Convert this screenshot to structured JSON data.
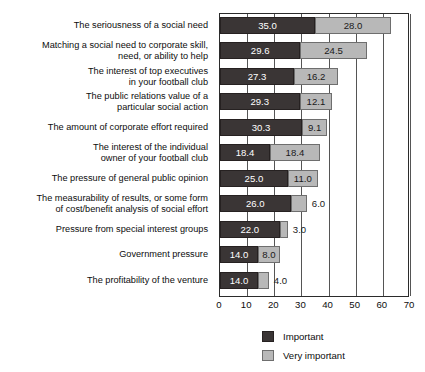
{
  "chart_data": {
    "type": "bar",
    "orientation": "horizontal",
    "stacked": true,
    "title": "",
    "subtitle": "",
    "xlabel": "",
    "ylabel": "",
    "xlim": [
      0,
      70
    ],
    "xticks": [
      0,
      10,
      20,
      30,
      40,
      50,
      60,
      70
    ],
    "xtick_labels": [
      "0",
      "10",
      "20",
      "30",
      "40",
      "50",
      "60",
      "70"
    ],
    "grid": true,
    "grid_axis": "x",
    "legend_position": "bottom",
    "categories": [
      "The seriousness of a social need",
      "Matching a social need to corporate skill,\nneed, or ability to help",
      "The interest of top executives\nin your football club",
      "The public relations value of a\nparticular social action",
      "The amount of corporate effort required",
      "The interest of the individual\nowner of your football club",
      "The pressure of general public opinion",
      "The measurability of results, or some form\nof cost/benefit analysis of social effort",
      "Pressure from special interest groups",
      "Government pressure",
      "The profitability of the venture"
    ],
    "series": [
      {
        "name": "Important",
        "color": "#3a3535",
        "values": [
          35.0,
          29.6,
          27.3,
          29.3,
          30.3,
          18.4,
          25.0,
          26.0,
          22.0,
          14.0,
          14.0
        ],
        "labels": [
          "35.0",
          "29.6",
          "27.3",
          "29.3",
          "30.3",
          "18.4",
          "25.0",
          "26.0",
          "22.0",
          "14.0",
          "14.0"
        ]
      },
      {
        "name": "Very important",
        "color": "#b8b8b8",
        "values": [
          28.0,
          24.5,
          16.2,
          12.1,
          9.1,
          18.4,
          11.0,
          6.0,
          3.0,
          8.0,
          4.0
        ],
        "labels": [
          "28.0",
          "24.5",
          "16.2",
          "12.1",
          "9.1",
          "18.4",
          "11.0",
          "6.0",
          "3.0",
          "8.0",
          "4.0"
        ]
      }
    ],
    "totals": [
      63.0,
      54.1,
      43.5,
      41.4,
      39.4,
      36.8,
      36.0,
      32.0,
      25.0,
      22.0,
      18.0
    ]
  },
  "legend": {
    "entries": [
      {
        "label": "Important",
        "swatch": "important"
      },
      {
        "label": "Very important",
        "swatch": "very-important"
      }
    ]
  },
  "colors": {
    "important": "#3a3535",
    "very_important": "#b8b8b8",
    "axis": "#2b2b2b",
    "gridline": "#555555",
    "background": "#ffffff",
    "text": "#0d0d0d"
  }
}
